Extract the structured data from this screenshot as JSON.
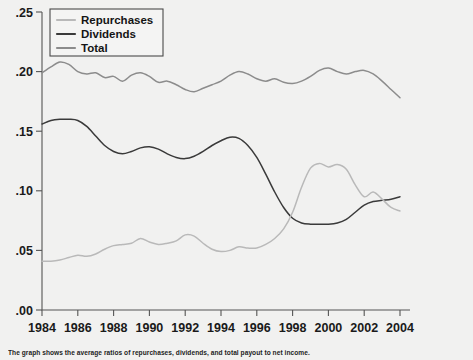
{
  "figure": {
    "background_color": "#f1f1f0",
    "caption": "The graph shows the average ratios of repurchases, dividends, and total payout to net income."
  },
  "legend": {
    "position": "top-left",
    "entries": [
      {
        "label": "Repurchases",
        "color": "#b9b9b9"
      },
      {
        "label": "Dividends",
        "color": "#3a3a3a"
      },
      {
        "label": "Total",
        "color": "#8c8c8c"
      }
    ]
  },
  "chart_data": {
    "type": "line",
    "title": "",
    "xlabel": "",
    "ylabel": "",
    "xlim": [
      1984,
      2004
    ],
    "ylim": [
      0.0,
      0.25
    ],
    "grid": false,
    "ytick_labels": [
      ".25",
      ".20",
      ".15",
      ".10",
      ".05",
      ".00"
    ],
    "ytick_values": [
      0.25,
      0.2,
      0.15,
      0.1,
      0.05,
      0.0
    ],
    "xtick_labels": [
      "1984",
      "1986",
      "1988",
      "1990",
      "1992",
      "1994",
      "1996",
      "1998",
      "2000",
      "2002",
      "2004"
    ],
    "xtick_values": [
      1984,
      1986,
      1988,
      1990,
      1992,
      1994,
      1996,
      1998,
      2000,
      2002,
      2004
    ],
    "x": [
      1984,
      1984.5,
      1985,
      1985.5,
      1986,
      1986.5,
      1987,
      1987.5,
      1988,
      1988.5,
      1989,
      1989.5,
      1990,
      1990.5,
      1991,
      1991.5,
      1992,
      1992.5,
      1993,
      1993.5,
      1994,
      1994.5,
      1995,
      1995.5,
      1996,
      1996.5,
      1997,
      1997.5,
      1998,
      1998.5,
      1999,
      1999.5,
      2000,
      2000.5,
      2001,
      2001.5,
      2002,
      2002.5,
      2003,
      2003.5,
      2004
    ],
    "series": [
      {
        "name": "Total",
        "color": "#8c8c8c",
        "values": [
          0.199,
          0.204,
          0.208,
          0.206,
          0.2,
          0.198,
          0.199,
          0.195,
          0.196,
          0.192,
          0.197,
          0.199,
          0.196,
          0.191,
          0.192,
          0.189,
          0.185,
          0.183,
          0.186,
          0.189,
          0.192,
          0.197,
          0.2,
          0.198,
          0.194,
          0.192,
          0.194,
          0.191,
          0.19,
          0.192,
          0.196,
          0.201,
          0.203,
          0.2,
          0.198,
          0.2,
          0.201,
          0.198,
          0.192,
          0.185,
          0.178
        ]
      },
      {
        "name": "Dividends",
        "color": "#3a3a3a",
        "values": [
          0.156,
          0.159,
          0.16,
          0.16,
          0.159,
          0.154,
          0.146,
          0.138,
          0.133,
          0.131,
          0.133,
          0.136,
          0.137,
          0.135,
          0.131,
          0.128,
          0.127,
          0.129,
          0.133,
          0.138,
          0.142,
          0.145,
          0.144,
          0.138,
          0.128,
          0.114,
          0.099,
          0.086,
          0.077,
          0.073,
          0.072,
          0.072,
          0.072,
          0.073,
          0.076,
          0.082,
          0.088,
          0.091,
          0.092,
          0.093,
          0.095
        ]
      },
      {
        "name": "Repurchases",
        "color": "#b9b9b9",
        "values": [
          0.041,
          0.041,
          0.042,
          0.044,
          0.046,
          0.045,
          0.047,
          0.051,
          0.054,
          0.055,
          0.056,
          0.06,
          0.057,
          0.055,
          0.056,
          0.058,
          0.063,
          0.062,
          0.056,
          0.051,
          0.049,
          0.05,
          0.053,
          0.052,
          0.052,
          0.055,
          0.06,
          0.068,
          0.082,
          0.103,
          0.119,
          0.123,
          0.12,
          0.122,
          0.118,
          0.105,
          0.095,
          0.099,
          0.093,
          0.086,
          0.083
        ]
      }
    ]
  }
}
